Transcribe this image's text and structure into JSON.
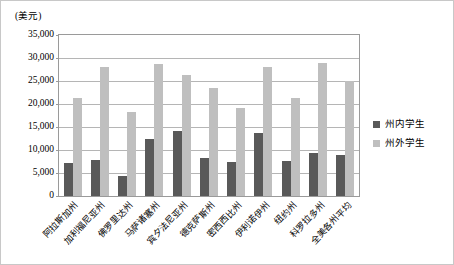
{
  "chart_data": {
    "type": "bar",
    "title": "",
    "subtitle": "",
    "xlabel": "",
    "ylabel": "(美元)",
    "ylim": [
      0,
      35000
    ],
    "ytick_labels": [
      "35,000",
      "30,000",
      "25,000",
      "20,000",
      "15,000",
      "10,000",
      "5,000",
      "0"
    ],
    "ytick_values": [
      35000,
      30000,
      25000,
      20000,
      15000,
      10000,
      5000,
      0
    ],
    "grid": true,
    "legend_position": "right",
    "categories": [
      "阿拉斯加州",
      "加利福尼亚州",
      "佛罗里达州",
      "马萨诸塞州",
      "宾夕法尼亚州",
      "德克萨斯州",
      "密西西比州",
      "伊利诺伊州",
      "纽约州",
      "科罗拉多州",
      "全美各州平均"
    ],
    "series": [
      {
        "name": "州内学生",
        "color": "#595959",
        "values": [
          7100,
          7800,
          4400,
          12300,
          14100,
          8300,
          7500,
          13700,
          7700,
          9400,
          8900
        ]
      },
      {
        "name": "州外学生",
        "color": "#bfbfbf",
        "values": [
          21400,
          28100,
          18200,
          28700,
          26300,
          23500,
          19100,
          28100,
          21400,
          29000,
          25100
        ]
      }
    ]
  },
  "legend": {
    "items": [
      {
        "label": "州内学生"
      },
      {
        "label": "州外学生"
      }
    ]
  },
  "colors": {
    "in_state": "#595959",
    "out_state": "#bfbfbf",
    "gridline": "#b5b5b5",
    "axis": "#9a9a9a",
    "frame_border": "#c8c8c8",
    "background": "#ffffff"
  }
}
